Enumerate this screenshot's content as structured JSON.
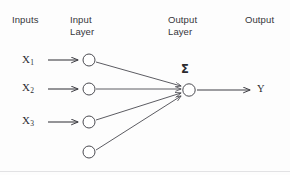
{
  "diagram": {
    "background_color": "#fdfdfd",
    "stroke_color": "#4a4a50",
    "text_color": "#35353a",
    "columns": [
      {
        "id": "inputs",
        "label": "Inputs",
        "x": 12,
        "y": 14
      },
      {
        "id": "input-layer",
        "label": "Input\nLayer",
        "x": 70,
        "y": 14
      },
      {
        "id": "output-layer",
        "label": "Output\nLayer",
        "x": 168,
        "y": 14
      },
      {
        "id": "output",
        "label": "Output",
        "x": 245,
        "y": 14
      }
    ],
    "inputs": [
      {
        "id": "x1",
        "base": "X",
        "subscript": "1",
        "label_x": 22,
        "label_y": 54,
        "arrow_y": 60,
        "node_cx": 89,
        "node_cy": 60
      },
      {
        "id": "x2",
        "base": "X",
        "subscript": "2",
        "label_x": 22,
        "label_y": 82,
        "arrow_y": 89,
        "node_cx": 89,
        "node_cy": 89
      },
      {
        "id": "x3",
        "base": "X",
        "subscript": "3",
        "label_x": 22,
        "label_y": 115,
        "arrow_y": 122,
        "node_cx": 89,
        "node_cy": 122
      }
    ],
    "bias_node": {
      "id": "bias",
      "node_cx": 89,
      "node_cy": 152,
      "label": ""
    },
    "input_arrow": {
      "x_start": 48,
      "x_end": 79
    },
    "node_radius": 6,
    "output_neuron": {
      "id": "summation-neuron",
      "cx": 189,
      "cy": 90,
      "symbol": "Σ",
      "symbol_x": 181,
      "symbol_y": 63
    },
    "output_arrow": {
      "x_start": 197,
      "x_end": 251,
      "y": 90
    },
    "output_label": {
      "text": "Y",
      "x": 257,
      "y": 84
    },
    "connections": [
      {
        "from": "x1",
        "from_x": 96,
        "from_y": 62,
        "to_x": 182,
        "to_y": 86
      },
      {
        "from": "x2",
        "from_x": 96,
        "from_y": 89,
        "to_x": 182,
        "to_y": 89
      },
      {
        "from": "x3",
        "from_x": 96,
        "from_y": 120,
        "to_x": 182,
        "to_y": 93
      },
      {
        "from": "bias",
        "from_x": 96,
        "from_y": 150,
        "to_x": 182,
        "to_y": 96
      }
    ],
    "baseline_rule": {
      "y": 171,
      "x_start": 0,
      "x_end": 290
    }
  }
}
